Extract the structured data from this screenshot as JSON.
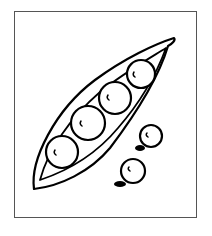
{
  "illustration": {
    "subject": "Pea pod with peas",
    "style": "black line drawing",
    "pod": {
      "peas_in_pod": 4
    },
    "loose_peas": 2,
    "colors": {
      "line": "#000000",
      "frame": "#555555",
      "background": "#ffffff"
    }
  }
}
